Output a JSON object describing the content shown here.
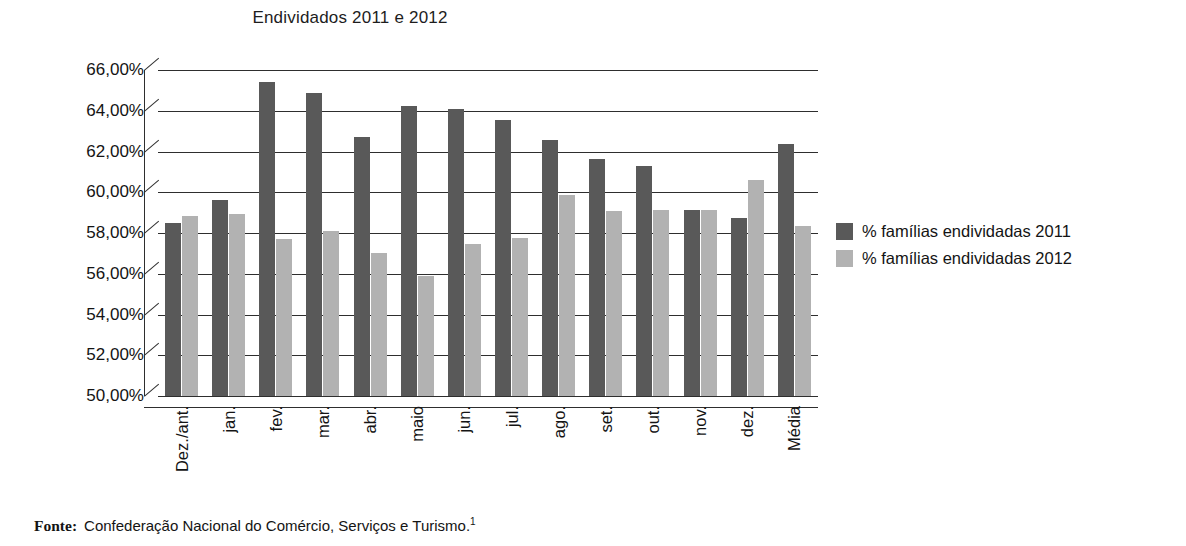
{
  "chart_data": {
    "type": "bar",
    "title": "Endividados 2011 e 2012",
    "xlabel": "",
    "ylabel": "",
    "ylim": [
      50.0,
      66.0
    ],
    "ytick_step": 2.0,
    "ytick_labels": [
      "66,00%",
      "64,00%",
      "62,00%",
      "60,00%",
      "58,00%",
      "56,00%",
      "54,00%",
      "52,00%",
      "50,00%"
    ],
    "ytick_values": [
      66.0,
      64.0,
      62.0,
      60.0,
      58.0,
      56.0,
      54.0,
      52.0,
      50.0
    ],
    "grid": true,
    "legend_position": "right",
    "categories": [
      "Dez./ant.",
      "jan.",
      "fev.",
      "mar.",
      "abr.",
      "maio",
      "jun.",
      "jul.",
      "ago.",
      "set.",
      "out.",
      "nov.",
      "dez.",
      "Média"
    ],
    "series": [
      {
        "name": "% famílias endividadas 2011",
        "color": "#595959",
        "values": [
          58.5,
          59.6,
          65.4,
          64.85,
          62.7,
          64.25,
          64.1,
          63.55,
          62.55,
          61.65,
          61.3,
          59.15,
          58.75,
          62.35
        ]
      },
      {
        "name": "% famílias endividadas 2012",
        "color": "#b2b2b2",
        "values": [
          58.85,
          58.95,
          57.7,
          58.1,
          57.0,
          55.9,
          57.45,
          57.75,
          59.85,
          59.1,
          59.15,
          59.15,
          60.6,
          58.35
        ]
      }
    ]
  },
  "legend": {
    "items": [
      {
        "label": "% famílias endividadas 2011",
        "color": "#595959"
      },
      {
        "label": "% famílias endividadas 2012",
        "color": "#b2b2b2"
      }
    ]
  },
  "source": {
    "label": "Fonte:",
    "text": "Confederação Nacional do Comércio, Serviços e Turismo.",
    "footnote_marker": "1"
  }
}
